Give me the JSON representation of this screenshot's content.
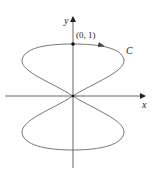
{
  "diagram": {
    "type": "parametric-curve",
    "axes": {
      "x_label": "x",
      "y_label": "y"
    },
    "curve_label": "C",
    "point_label": "(0, 1)",
    "colors": {
      "axis": "#555555",
      "curve": "#666666",
      "point": "#111111",
      "text": "#222222"
    }
  }
}
